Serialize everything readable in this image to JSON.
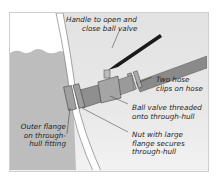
{
  "diagram": {
    "colors": {
      "background": "#e5e5e5",
      "water": "#b9b9b9",
      "hull": "#ffffff",
      "fitting": "#8f8f8f",
      "hose": "#8a8a8a",
      "handle": "#1a1a1a",
      "label_text": "#1e1e1e"
    },
    "labels": {
      "handle": [
        "Handle to open and",
        "close ball valve"
      ],
      "hose_clips": [
        "Two hose",
        "clips on hose"
      ],
      "ball_valve": [
        "Ball valve threaded",
        "onto through-hull"
      ],
      "nut": [
        "Nut with large",
        "flange secures",
        "through-hull"
      ],
      "outer_flange": [
        "Outer flange",
        "on through-",
        "hull fitting"
      ]
    }
  }
}
